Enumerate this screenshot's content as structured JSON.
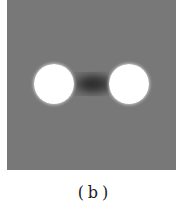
{
  "figure": {
    "panel_color": "#787878",
    "blob_color": "#ffffff",
    "blobs": [
      "left-bright-spot",
      "right-bright-spot"
    ],
    "caption": "(b)"
  }
}
